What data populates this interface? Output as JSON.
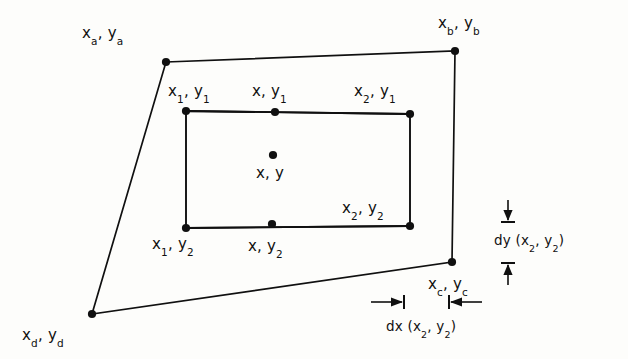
{
  "figure": {
    "kind": "bilinear-interpolation-cell-diagram",
    "background_color": "#fdfdfb",
    "line_color": "#101010",
    "text_color": "#101010",
    "outer_quad": {
      "name": "outer-quadrilateral",
      "vertices": [
        {
          "id": "a",
          "x": 166,
          "y": 62
        },
        {
          "id": "b",
          "x": 455,
          "y": 51
        },
        {
          "id": "c",
          "x": 452,
          "y": 262
        },
        {
          "id": "d",
          "x": 92,
          "y": 314
        }
      ]
    },
    "inner_rect": {
      "name": "inner-rectangle",
      "vertices": [
        {
          "id": "tl",
          "x": 186,
          "y": 111
        },
        {
          "id": "tr",
          "x": 410,
          "y": 114
        },
        {
          "id": "br",
          "x": 410,
          "y": 226
        },
        {
          "id": "bl",
          "x": 186,
          "y": 228
        }
      ]
    },
    "points": [
      {
        "id": "a",
        "x": 166,
        "y": 62
      },
      {
        "id": "b",
        "x": 455,
        "y": 51
      },
      {
        "id": "c",
        "x": 452,
        "y": 262
      },
      {
        "id": "d",
        "x": 92,
        "y": 314
      },
      {
        "id": "tl",
        "x": 186,
        "y": 111
      },
      {
        "id": "tc",
        "x": 275,
        "y": 112
      },
      {
        "id": "tr",
        "x": 410,
        "y": 114
      },
      {
        "id": "bl",
        "x": 186,
        "y": 228
      },
      {
        "id": "bc",
        "x": 272,
        "y": 224
      },
      {
        "id": "br",
        "x": 410,
        "y": 226
      },
      {
        "id": "center",
        "x": 273,
        "y": 155
      }
    ]
  },
  "labels": {
    "xa_ya": {
      "text": "x",
      "sub1": "a",
      "sep": ", y",
      "sub2": "a",
      "x": 82,
      "y": 26
    },
    "xb_yb": {
      "text": "x",
      "sub1": "b",
      "sep": ", y",
      "sub2": "b",
      "x": 438,
      "y": 16
    },
    "xc_yc": {
      "text": "x",
      "sub1": "c",
      "sep": ", y",
      "sub2": "c",
      "x": 428,
      "y": 277
    },
    "xd_yd": {
      "text": "x",
      "sub1": "d",
      "sep": ", y",
      "sub2": "d",
      "x": 22,
      "y": 328
    },
    "x1_y1": {
      "text": "x",
      "sub1": "1",
      "sep": ", y",
      "sub2": "1",
      "x": 168,
      "y": 84
    },
    "x_y1": {
      "text": "x",
      "sub1": "",
      "sep": ", y",
      "sub2": "1",
      "x": 252,
      "y": 84
    },
    "x2_y1": {
      "text": "x",
      "sub1": "2",
      "sep": ", y",
      "sub2": "1",
      "x": 354,
      "y": 84
    },
    "x1_y2": {
      "text": "x",
      "sub1": "1",
      "sep": ", y",
      "sub2": "2",
      "x": 152,
      "y": 237
    },
    "x_y2": {
      "text": "x",
      "sub1": "",
      "sep": ", y",
      "sub2": "2",
      "x": 248,
      "y": 239
    },
    "x2_y2": {
      "text": "x",
      "sub1": "2",
      "sep": ", y",
      "sub2": "2",
      "x": 342,
      "y": 201
    },
    "x_y": {
      "text": "x",
      "sub1": "",
      "sep": ", y",
      "sub2": "",
      "x": 256,
      "y": 166
    }
  },
  "annotations": {
    "dy": {
      "name": "dy-dimension",
      "prefix": "dy",
      "arg_open": " (x",
      "arg_sub1": "2",
      "arg_mid": ", y",
      "arg_sub2": "2",
      "arg_close": ")",
      "label_x": 494,
      "label_y": 234,
      "line_x": 508,
      "tick_top_y": 222,
      "tick_bottom_y": 263,
      "tick_half_width": 7
    },
    "dx": {
      "name": "dx-dimension",
      "prefix": "dx",
      "arg_open": " (x",
      "arg_sub1": "2",
      "arg_mid": ", y",
      "arg_sub2": "2",
      "arg_close": ")",
      "label_x": 386,
      "label_y": 320,
      "line_y": 302,
      "tick_left_x": 404,
      "tick_right_x": 449,
      "tick_half_height": 7,
      "arrow_left_start": 371,
      "arrow_right_end": 482
    }
  }
}
